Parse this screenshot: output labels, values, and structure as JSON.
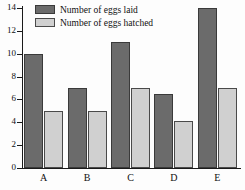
{
  "chart_data": {
    "type": "bar",
    "title": "",
    "subtitle": "",
    "xlabel": "",
    "ylabel": "",
    "categories": [
      "A",
      "B",
      "C",
      "D",
      "E"
    ],
    "series": [
      {
        "name": "Number of eggs laid",
        "color": "#6b6b6b",
        "values": [
          10,
          7,
          11,
          6.5,
          14
        ]
      },
      {
        "name": "Number of eggs hatched",
        "color": "#d0d0d0",
        "values": [
          5,
          5,
          7,
          4.1,
          7
        ]
      }
    ],
    "ylim": [
      0,
      14
    ],
    "y_ticks": [
      0,
      2,
      4,
      6,
      8,
      10,
      12,
      14
    ],
    "y_tick_labels": [
      "0",
      "2",
      "4",
      "6",
      "8",
      "10",
      "12",
      "14"
    ],
    "grid": false,
    "legend_position": "top-left-inside",
    "axis_color": "#1a1a1a",
    "background": "#fdfdfd"
  },
  "legend": {
    "entries": [
      {
        "label": "Number of eggs laid",
        "swatch": "laid"
      },
      {
        "label": "Number of eggs hatched",
        "swatch": "hatched"
      }
    ]
  }
}
